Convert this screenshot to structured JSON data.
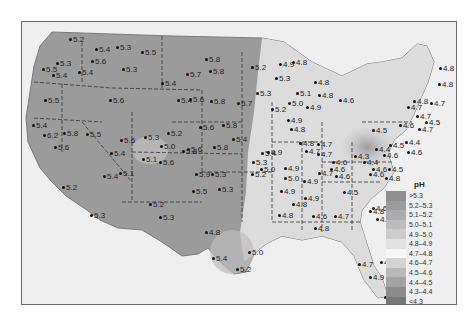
{
  "map": {
    "title": "pH of precipitation, contiguous United States",
    "legend": {
      "title": "pH",
      "items": [
        {
          "label": ">5.3",
          "color": "#8f8f8f"
        },
        {
          "label": "5.2–5.3",
          "color": "#9c9c9c"
        },
        {
          "label": "5.1–5.2",
          "color": "#acacac"
        },
        {
          "label": "5.0–5.1",
          "color": "#bcbcbc"
        },
        {
          "label": "4.9–5.0",
          "color": "#cdcdcd"
        },
        {
          "label": "4.8–4.9",
          "color": "#e2e2e2"
        },
        {
          "label": "4.7–4.8",
          "color": "#f7f7f7"
        },
        {
          "label": "4.6–4.7",
          "color": "#d4d4d4"
        },
        {
          "label": "4.5–4.6",
          "color": "#b8b8b8"
        },
        {
          "label": "4.4–4.5",
          "color": "#a2a2a2"
        },
        {
          "label": "4.3–4.4",
          "color": "#8c8c8c"
        },
        {
          "label": "<4.3",
          "color": "#777777"
        }
      ]
    },
    "points": [
      {
        "v": "5.2",
        "x": 49,
        "y": 18
      },
      {
        "v": "5.4",
        "x": 75,
        "y": 28
      },
      {
        "v": "5.3",
        "x": 96,
        "y": 26
      },
      {
        "v": "5.5",
        "x": 121,
        "y": 31
      },
      {
        "v": "5.3",
        "x": 36,
        "y": 42
      },
      {
        "v": "5.5",
        "x": 22,
        "y": 48
      },
      {
        "v": "5.6",
        "x": 71,
        "y": 40
      },
      {
        "v": "5.3",
        "x": 102,
        "y": 48
      },
      {
        "v": "5.4",
        "x": 32,
        "y": 54
      },
      {
        "v": "5.4",
        "x": 58,
        "y": 51
      },
      {
        "v": "5.7",
        "x": 166,
        "y": 53
      },
      {
        "v": "5.8",
        "x": 185,
        "y": 38
      },
      {
        "v": "5.8",
        "x": 189,
        "y": 50
      },
      {
        "v": "5.4",
        "x": 141,
        "y": 62
      },
      {
        "v": "5.2",
        "x": 231,
        "y": 46
      },
      {
        "v": "4.9",
        "x": 259,
        "y": 43
      },
      {
        "v": "4.8",
        "x": 272,
        "y": 41
      },
      {
        "v": "5.5",
        "x": 24,
        "y": 79
      },
      {
        "v": "5.6",
        "x": 89,
        "y": 79
      },
      {
        "v": "5.4",
        "x": 157,
        "y": 79
      },
      {
        "v": "5.6",
        "x": 169,
        "y": 78
      },
      {
        "v": "5.8",
        "x": 190,
        "y": 80
      },
      {
        "v": "5.3",
        "x": 236,
        "y": 72
      },
      {
        "v": "5.7",
        "x": 217,
        "y": 82
      },
      {
        "v": "5.3",
        "x": 255,
        "y": 57
      },
      {
        "v": "5.1",
        "x": 276,
        "y": 72
      },
      {
        "v": "5.0",
        "x": 268,
        "y": 82
      },
      {
        "v": "4.9",
        "x": 286,
        "y": 86
      },
      {
        "v": "5.2",
        "x": 251,
        "y": 88
      },
      {
        "v": "4.9",
        "x": 267,
        "y": 99
      },
      {
        "v": "4.8",
        "x": 294,
        "y": 61
      },
      {
        "v": "4.8",
        "x": 298,
        "y": 74
      },
      {
        "v": "4.6",
        "x": 319,
        "y": 79
      },
      {
        "v": "5.4",
        "x": 12,
        "y": 104
      },
      {
        "v": "6.2",
        "x": 23,
        "y": 114
      },
      {
        "v": "5.8",
        "x": 43,
        "y": 112
      },
      {
        "v": "5.6",
        "x": 34,
        "y": 126
      },
      {
        "v": "5.5",
        "x": 66,
        "y": 113
      },
      {
        "v": "5.6",
        "x": 100,
        "y": 119
      },
      {
        "v": "5.4",
        "x": 90,
        "y": 132
      },
      {
        "v": "5.3",
        "x": 124,
        "y": 116
      },
      {
        "v": "5.2",
        "x": 147,
        "y": 112
      },
      {
        "v": "5.0",
        "x": 140,
        "y": 125
      },
      {
        "v": "5.8",
        "x": 162,
        "y": 130
      },
      {
        "v": "5.6",
        "x": 167,
        "y": 128
      },
      {
        "v": "5.8",
        "x": 193,
        "y": 126
      },
      {
        "v": "5.6",
        "x": 179,
        "y": 106
      },
      {
        "v": "5.8",
        "x": 202,
        "y": 104
      },
      {
        "v": "5.4",
        "x": 212,
        "y": 118
      },
      {
        "v": "5.4",
        "x": 241,
        "y": 132
      },
      {
        "v": "4.9",
        "x": 247,
        "y": 131
      },
      {
        "v": "5.3",
        "x": 232,
        "y": 141
      },
      {
        "v": "5.1",
        "x": 122,
        "y": 138
      },
      {
        "v": "5.6",
        "x": 139,
        "y": 141
      },
      {
        "v": "5.1",
        "x": 99,
        "y": 152
      },
      {
        "v": "5.4",
        "x": 83,
        "y": 155
      },
      {
        "v": "5.2",
        "x": 42,
        "y": 166
      },
      {
        "v": "5.9",
        "x": 175,
        "y": 153
      },
      {
        "v": "5.3",
        "x": 191,
        "y": 153
      },
      {
        "v": "5.5",
        "x": 172,
        "y": 170
      },
      {
        "v": "5.3",
        "x": 198,
        "y": 168
      },
      {
        "v": "5.2",
        "x": 129,
        "y": 183
      },
      {
        "v": "5.3",
        "x": 139,
        "y": 196
      },
      {
        "v": "5.3",
        "x": 70,
        "y": 194
      },
      {
        "v": "5.2",
        "x": 231,
        "y": 153
      },
      {
        "v": "5.0",
        "x": 240,
        "y": 148
      },
      {
        "v": "4.9",
        "x": 264,
        "y": 147
      },
      {
        "v": "5.0",
        "x": 264,
        "y": 157
      },
      {
        "v": "4.9",
        "x": 260,
        "y": 170
      },
      {
        "v": "4.9",
        "x": 283,
        "y": 160
      },
      {
        "v": "4.8",
        "x": 258,
        "y": 194
      },
      {
        "v": "4.9",
        "x": 284,
        "y": 177
      },
      {
        "v": "4.8",
        "x": 272,
        "y": 183
      },
      {
        "v": "4.6",
        "x": 292,
        "y": 195
      },
      {
        "v": "4.8",
        "x": 294,
        "y": 207
      },
      {
        "v": "4.8",
        "x": 185,
        "y": 211
      },
      {
        "v": "5.4",
        "x": 192,
        "y": 237
      },
      {
        "v": "5.0",
        "x": 228,
        "y": 231
      },
      {
        "v": "5.2",
        "x": 216,
        "y": 248
      },
      {
        "v": "4.8",
        "x": 349,
        "y": 190
      },
      {
        "v": "4.7",
        "x": 356,
        "y": 198
      },
      {
        "v": "4.8",
        "x": 360,
        "y": 241
      },
      {
        "v": "4.7",
        "x": 338,
        "y": 243
      },
      {
        "v": "4.9",
        "x": 349,
        "y": 256
      },
      {
        "v": "5.1",
        "x": 364,
        "y": 276
      },
      {
        "v": "4.8",
        "x": 419,
        "y": 47
      },
      {
        "v": "4.8",
        "x": 418,
        "y": 63
      },
      {
        "v": "4.7",
        "x": 387,
        "y": 86
      },
      {
        "v": "4.8",
        "x": 393,
        "y": 80
      },
      {
        "v": "4.7",
        "x": 396,
        "y": 95
      },
      {
        "v": "4.7",
        "x": 410,
        "y": 82
      },
      {
        "v": "4.5",
        "x": 405,
        "y": 101
      },
      {
        "v": "4.7",
        "x": 398,
        "y": 108
      },
      {
        "v": "4.5",
        "x": 352,
        "y": 109
      },
      {
        "v": "4.6",
        "x": 379,
        "y": 104
      },
      {
        "v": "4.4",
        "x": 355,
        "y": 128
      },
      {
        "v": "4.5",
        "x": 369,
        "y": 124
      },
      {
        "v": "4.4",
        "x": 385,
        "y": 121
      },
      {
        "v": "4.6",
        "x": 387,
        "y": 131
      },
      {
        "v": "4.3",
        "x": 334,
        "y": 135
      },
      {
        "v": "4.4",
        "x": 343,
        "y": 141
      },
      {
        "v": "4.6",
        "x": 312,
        "y": 141
      },
      {
        "v": "4.7",
        "x": 297,
        "y": 123
      },
      {
        "v": "4.7",
        "x": 297,
        "y": 133
      },
      {
        "v": "4.7",
        "x": 298,
        "y": 152
      },
      {
        "v": "4.6",
        "x": 310,
        "y": 148
      },
      {
        "v": "4.6",
        "x": 315,
        "y": 155
      },
      {
        "v": "4.6",
        "x": 363,
        "y": 134
      },
      {
        "v": "4.6",
        "x": 352,
        "y": 148
      },
      {
        "v": "4.5",
        "x": 368,
        "y": 148
      },
      {
        "v": "4.6",
        "x": 349,
        "y": 153
      },
      {
        "v": "4.8",
        "x": 365,
        "y": 157
      },
      {
        "v": "4.5",
        "x": 323,
        "y": 171
      },
      {
        "v": "4.6",
        "x": 352,
        "y": 187
      },
      {
        "v": "4.7",
        "x": 314,
        "y": 195
      },
      {
        "v": "4.8",
        "x": 270,
        "y": 108
      },
      {
        "v": "4.8",
        "x": 279,
        "y": 122
      },
      {
        "v": "4.7",
        "x": 285,
        "y": 130
      }
    ]
  }
}
